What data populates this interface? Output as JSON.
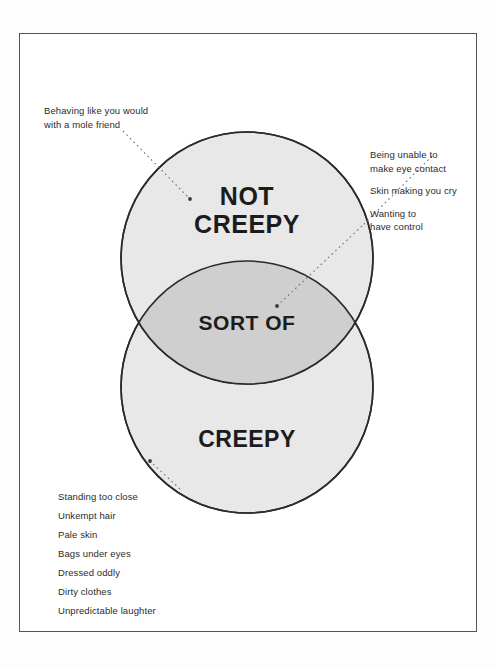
{
  "diagram": {
    "type": "venn",
    "sets": [
      {
        "id": "not-creepy",
        "label_lines": [
          "NOT",
          "CREEPY"
        ],
        "label": "NOT CREEPY",
        "fill": "#e8e8e8",
        "stroke": "#2b2b2b"
      },
      {
        "id": "creepy",
        "label_lines": [
          "CREEPY"
        ],
        "label": "CREEPY",
        "fill": "#e8e8e8",
        "stroke": "#2b2b2b"
      }
    ],
    "intersection": {
      "id": "sort-of",
      "label": "SORT OF",
      "fill": "#cfcfcf"
    }
  },
  "annotations": {
    "not_creepy_note": "Behaving like you would\nwith a mole friend",
    "intersection_notes": [
      "Being unable to\nmake eye contact",
      "Skin making you cry",
      "Wanting to\nhave control"
    ],
    "creepy_notes": [
      "Standing too close",
      "Unkempt hair",
      "Pale skin",
      "Bags under eyes",
      "Dressed oddly",
      "Dirty clothes",
      "Unpredictable laughter"
    ]
  },
  "colors": {
    "circle_fill": "#e8e8e8",
    "overlap_fill": "#cfcfcf",
    "outline": "#2b2b2b",
    "text": "#1c1c1c",
    "frame": "#555555",
    "leader": "#6e6e6e"
  }
}
